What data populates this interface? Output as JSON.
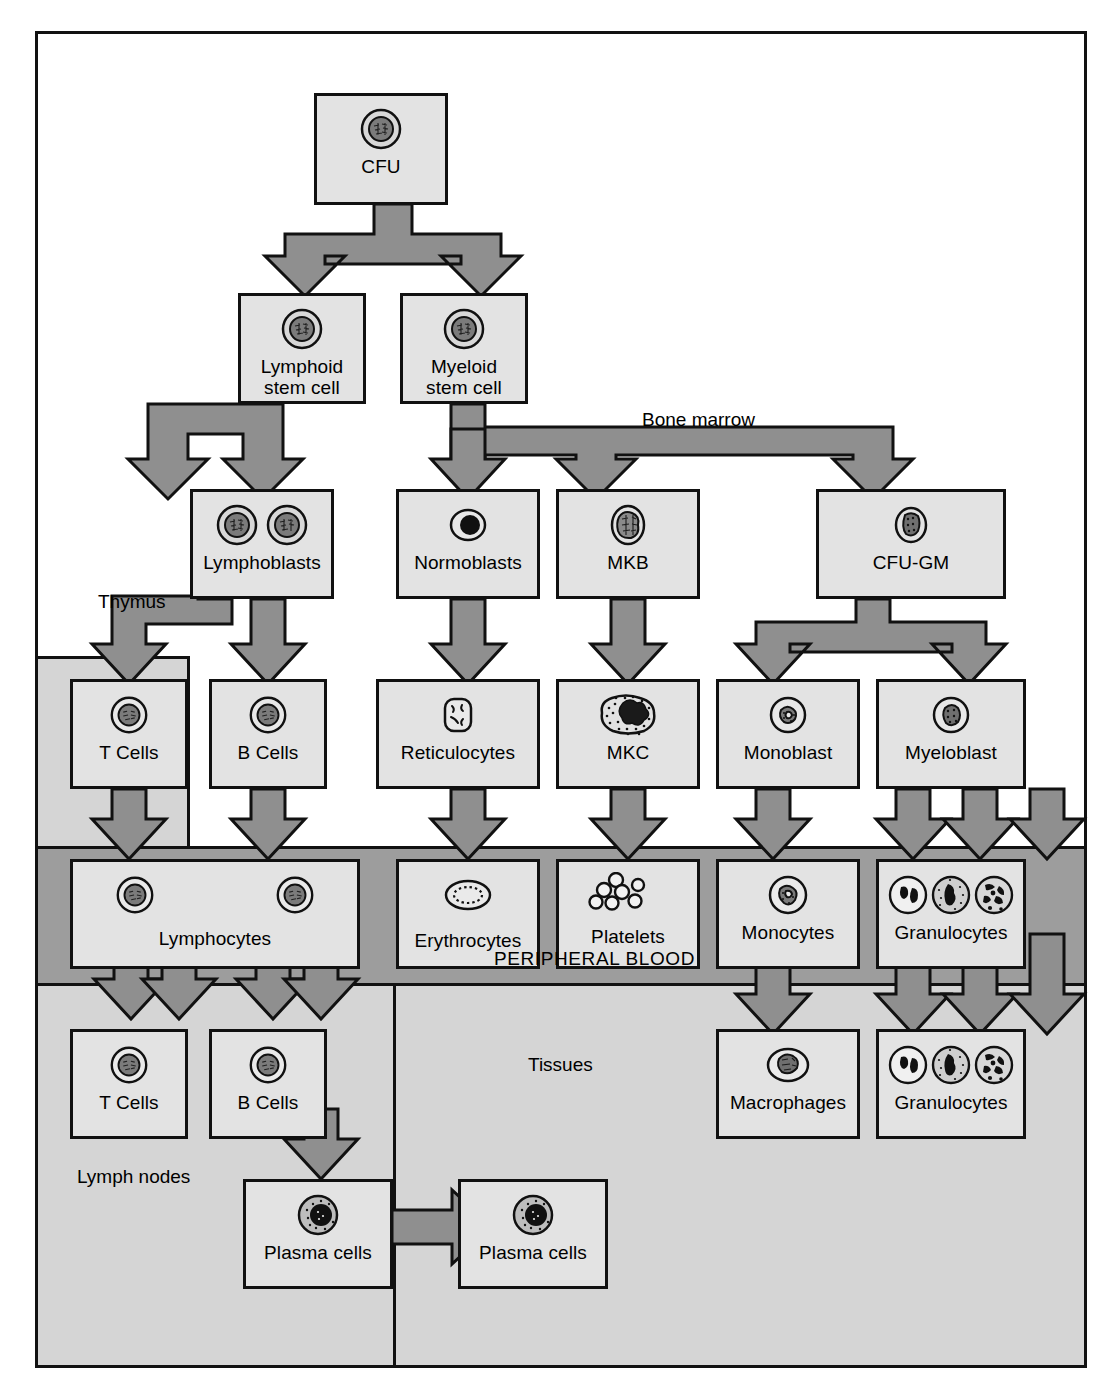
{
  "diagram": {
    "zones": {
      "bone_marrow": "Bone marrow",
      "thymus": "Thymus",
      "peripheral_blood": "PERIPHERAL BLOOD",
      "tissues": "Tissues",
      "lymph_nodes": "Lymph nodes"
    },
    "colors": {
      "box_fill": "#e3e3e3",
      "arrow_fill": "#8f8f8f",
      "peripheral_blood_band": "#9d9d9d",
      "tissue_fill": "#d5d5d5",
      "outline": "#111111",
      "page_background": "#ffffff"
    },
    "nodes": [
      {
        "id": "cfu",
        "label": "CFU",
        "icon": "stem-cell-icon",
        "cell_count": 1
      },
      {
        "id": "lymphoid",
        "label": "Lymphoid\nstem cell",
        "icon": "stem-cell-icon",
        "cell_count": 1
      },
      {
        "id": "myeloid",
        "label": "Myeloid\nstem cell",
        "icon": "stem-cell-icon",
        "cell_count": 1
      },
      {
        "id": "lymphoblasts",
        "label": "Lymphoblasts",
        "icon": "lymphoblast-icon",
        "cell_count": 2
      },
      {
        "id": "normoblasts",
        "label": "Normoblasts",
        "icon": "normoblast-icon",
        "cell_count": 1
      },
      {
        "id": "mkb",
        "label": "MKB",
        "icon": "megakaryoblast-icon",
        "cell_count": 1
      },
      {
        "id": "cfugm",
        "label": "CFU-GM",
        "icon": "cfu-gm-icon",
        "cell_count": 1
      },
      {
        "id": "tcells1",
        "label": "T Cells",
        "icon": "t-cell-icon",
        "cell_count": 1
      },
      {
        "id": "bcells1",
        "label": "B Cells",
        "icon": "b-cell-icon",
        "cell_count": 1
      },
      {
        "id": "reticulocytes",
        "label": "Reticulocytes",
        "icon": "reticulocyte-icon",
        "cell_count": 1
      },
      {
        "id": "mkc",
        "label": "MKC",
        "icon": "megakaryocyte-icon",
        "cell_count": 1
      },
      {
        "id": "monoblast",
        "label": "Monoblast",
        "icon": "monoblast-icon",
        "cell_count": 1
      },
      {
        "id": "myeloblast",
        "label": "Myeloblast",
        "icon": "myeloblast-icon",
        "cell_count": 1
      },
      {
        "id": "lymphocytes",
        "label": "Lymphocytes",
        "icon": "lymphocyte-icon",
        "cell_count": 2
      },
      {
        "id": "erythrocytes",
        "label": "Erythrocytes",
        "icon": "erythrocyte-icon",
        "cell_count": 1
      },
      {
        "id": "platelets",
        "label": "Platelets",
        "icon": "platelet-icon",
        "cell_count": 7
      },
      {
        "id": "monocytes",
        "label": "Monocytes",
        "icon": "monocyte-icon",
        "cell_count": 1
      },
      {
        "id": "granulocytes1",
        "label": "Granulocytes",
        "icon": "granulocyte-icon",
        "cell_count": 3
      },
      {
        "id": "tcells2",
        "label": "T Cells",
        "icon": "t-cell-icon",
        "cell_count": 1
      },
      {
        "id": "bcells2",
        "label": "B Cells",
        "icon": "b-cell-icon",
        "cell_count": 1
      },
      {
        "id": "macrophages",
        "label": "Macrophages",
        "icon": "macrophage-icon",
        "cell_count": 1
      },
      {
        "id": "granulocytes2",
        "label": "Granulocytes",
        "icon": "granulocyte-icon",
        "cell_count": 3
      },
      {
        "id": "plasma1",
        "label": "Plasma cells",
        "icon": "plasma-cell-icon",
        "cell_count": 1
      },
      {
        "id": "plasma2",
        "label": "Plasma cells",
        "icon": "plasma-cell-icon",
        "cell_count": 1
      }
    ],
    "edges": [
      {
        "from": "cfu",
        "to": "lymphoid",
        "direction": "down"
      },
      {
        "from": "cfu",
        "to": "myeloid",
        "direction": "down"
      },
      {
        "from": "lymphoid",
        "to": "lymphoblasts",
        "direction": "down"
      },
      {
        "from": "myeloid",
        "to": "normoblasts",
        "direction": "down"
      },
      {
        "from": "myeloid",
        "to": "mkb",
        "direction": "down"
      },
      {
        "from": "myeloid",
        "to": "cfugm",
        "direction": "down"
      },
      {
        "from": "lymphoblasts",
        "to": "tcells1",
        "direction": "down",
        "via": "Thymus"
      },
      {
        "from": "lymphoblasts",
        "to": "bcells1",
        "direction": "down"
      },
      {
        "from": "normoblasts",
        "to": "reticulocytes",
        "direction": "down"
      },
      {
        "from": "mkb",
        "to": "mkc",
        "direction": "down"
      },
      {
        "from": "cfugm",
        "to": "monoblast",
        "direction": "down"
      },
      {
        "from": "cfugm",
        "to": "myeloblast",
        "direction": "down"
      },
      {
        "from": "tcells1",
        "to": "lymphocytes",
        "direction": "down"
      },
      {
        "from": "bcells1",
        "to": "lymphocytes",
        "direction": "down"
      },
      {
        "from": "reticulocytes",
        "to": "erythrocytes",
        "direction": "down"
      },
      {
        "from": "mkc",
        "to": "platelets",
        "direction": "down"
      },
      {
        "from": "monoblast",
        "to": "monocytes",
        "direction": "down"
      },
      {
        "from": "myeloblast",
        "to": "granulocytes1",
        "direction": "down",
        "count": 3
      },
      {
        "from": "lymphocytes",
        "to": "tcells2",
        "direction": "bidirectional"
      },
      {
        "from": "lymphocytes",
        "to": "bcells2",
        "direction": "bidirectional"
      },
      {
        "from": "monocytes",
        "to": "macrophages",
        "direction": "down"
      },
      {
        "from": "granulocytes1",
        "to": "granulocytes2",
        "direction": "down",
        "count": 3
      },
      {
        "from": "bcells2",
        "to": "plasma1",
        "direction": "down"
      },
      {
        "from": "plasma1",
        "to": "plasma2",
        "direction": "right"
      }
    ]
  }
}
